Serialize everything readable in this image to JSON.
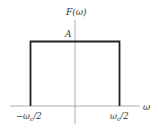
{
  "diagram": {
    "y_label": "F(ω)",
    "x_label": "ω",
    "amplitude_label": "A",
    "left_tick_label": "−ω_c/2",
    "left_tick_main": "−ω",
    "left_tick_sub": "c",
    "left_tick_tail": "/2",
    "right_tick_main": "ω",
    "right_tick_sub": "c",
    "right_tick_tail": "/2",
    "right_tick_label": "ω_c/2"
  },
  "colors": {
    "pulse": "#222222",
    "axes": "#888888"
  }
}
